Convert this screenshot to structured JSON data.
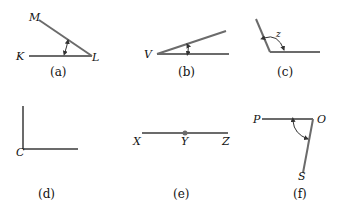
{
  "figure": {
    "line_color": "#6b6b6b",
    "panels": [
      {
        "id": "a",
        "caption": "(a)",
        "points": {
          "vertex": "L",
          "ray1_end": "M",
          "ray2_end": "K"
        },
        "marked_angle": true
      },
      {
        "id": "b",
        "caption": "(b)",
        "points": {
          "vertex": "V"
        },
        "marked_angle": true
      },
      {
        "id": "c",
        "caption": "(c)",
        "angle_variable": "z",
        "marked_angle": true
      },
      {
        "id": "d",
        "caption": "(d)",
        "points": {
          "vertex": "C"
        },
        "marked_angle": false
      },
      {
        "id": "e",
        "caption": "(e)",
        "points": {
          "left": "X",
          "middle": "Y",
          "right": "Z"
        },
        "marked_angle": false
      },
      {
        "id": "f",
        "caption": "(f)",
        "points": {
          "vertex": "O",
          "ray1_end": "P",
          "ray2_end": "S"
        },
        "marked_angle": true
      }
    ]
  }
}
